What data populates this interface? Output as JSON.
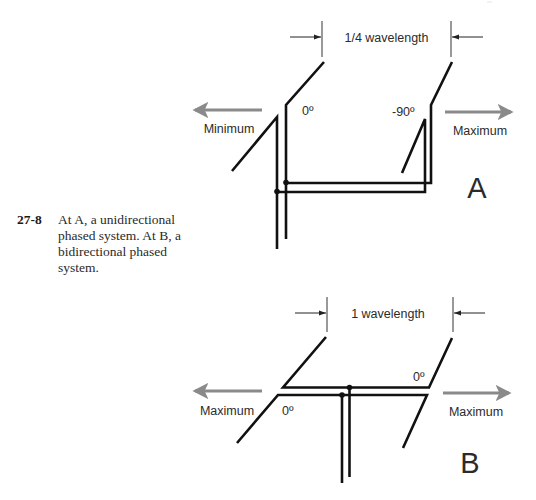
{
  "caption": {
    "number": "27-8",
    "text": "At A, a unidirectional phased system. At B, a bidirectional phased system."
  },
  "diagram_a": {
    "label": "A",
    "spacing_label": "1/4 wavelength",
    "left_direction_label": "Minimum",
    "right_direction_label": "Maximum",
    "left_phase_label": "0º",
    "right_phase_label": "-90º"
  },
  "diagram_b": {
    "label": "B",
    "spacing_label": "1 wavelength",
    "left_direction_label": "Maximum",
    "right_direction_label": "Maximum",
    "left_phase_label": "0º",
    "right_phase_label": "0º"
  },
  "colors": {
    "element": "#111111",
    "direction_arrow": "#8a8a8a",
    "text": "#2b2b2b"
  }
}
